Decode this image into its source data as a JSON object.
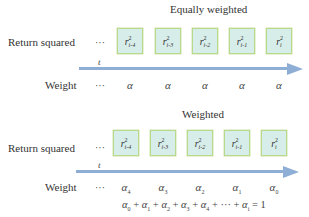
{
  "sections": [
    {
      "title": "Equally weighted",
      "row_label": "Return squared",
      "ellipsis": "···",
      "axis_label": "t",
      "weight_label": "Weight",
      "boxes": [
        {
          "base": "r",
          "sup": "2",
          "sub": "i-4"
        },
        {
          "base": "r",
          "sup": "2",
          "sub": "i-3"
        },
        {
          "base": "r",
          "sup": "2",
          "sub": "i-2"
        },
        {
          "base": "r",
          "sup": "2",
          "sub": "i-1"
        },
        {
          "base": "r",
          "sup": "2",
          "sub": "i"
        }
      ],
      "weights": [
        {
          "base": "α",
          "sub": ""
        },
        {
          "base": "α",
          "sub": ""
        },
        {
          "base": "α",
          "sub": ""
        },
        {
          "base": "α",
          "sub": ""
        },
        {
          "base": "α",
          "sub": ""
        }
      ]
    },
    {
      "title": "Weighted",
      "row_label": "Return squared",
      "ellipsis": "···",
      "axis_label": "t",
      "weight_label": "Weight",
      "boxes": [
        {
          "base": "r",
          "sup": "2",
          "sub": "i-4"
        },
        {
          "base": "r",
          "sup": "2",
          "sub": "i-3"
        },
        {
          "base": "r",
          "sup": "2",
          "sub": "i-2"
        },
        {
          "base": "r",
          "sup": "2",
          "sub": "i-1"
        },
        {
          "base": "r",
          "sup": "2",
          "sub": "i"
        }
      ],
      "weights": [
        {
          "base": "α",
          "sub": "4"
        },
        {
          "base": "α",
          "sub": "3"
        },
        {
          "base": "α",
          "sub": "2"
        },
        {
          "base": "α",
          "sub": "1"
        },
        {
          "base": "α",
          "sub": "0"
        }
      ],
      "equation": {
        "terms": [
          {
            "base": "α",
            "sub": "0"
          },
          {
            "base": "α",
            "sub": "1"
          },
          {
            "base": "α",
            "sub": "2"
          },
          {
            "base": "α",
            "sub": "3"
          },
          {
            "base": "α",
            "sub": "4"
          },
          {
            "base": "···",
            "sub": ""
          },
          {
            "base": "α",
            "sub": "i"
          }
        ],
        "operator": "+",
        "equals": "=",
        "result": "1"
      }
    }
  ],
  "colors": {
    "box_fill": "#d7ede9",
    "box_border": "#b8d88a",
    "arrow": "#8eaed6"
  }
}
